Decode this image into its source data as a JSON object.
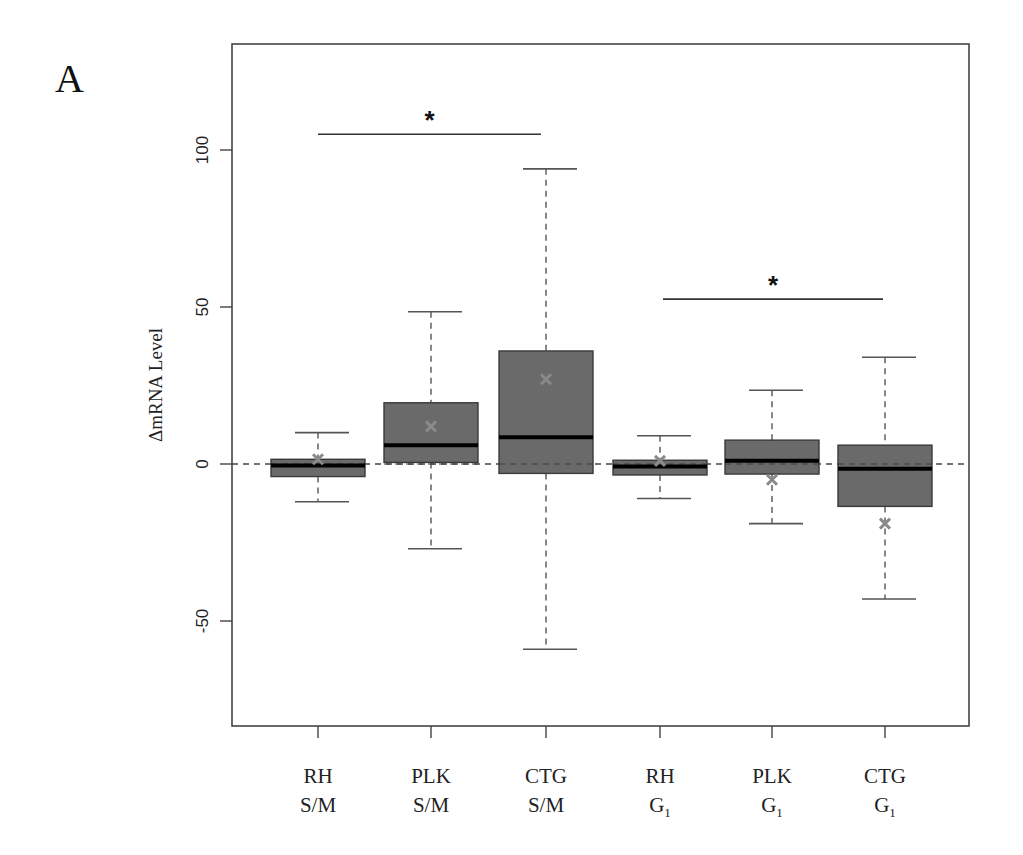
{
  "panel_label": "A",
  "colors": {
    "box_fill": "#6a6a6a",
    "box_stroke": "#3a3a3a",
    "median": "#000000",
    "whisker": "#555555",
    "mean_marker": "#8a8a8a",
    "axis": "#444444",
    "reference_line": "#444444",
    "background": "#ffffff"
  },
  "chart_data": {
    "type": "boxplot",
    "title": "",
    "xlabel": "",
    "ylabel": "ΔmRNA Level",
    "ylim": [
      -83,
      133
    ],
    "yticks": [
      -50,
      0,
      50,
      100
    ],
    "ytick_labels": [
      "-50",
      "0",
      "50",
      "100"
    ],
    "grid": false,
    "legend": null,
    "reference_line": {
      "y": 0,
      "style": "dashed"
    },
    "categories": [
      {
        "line1": "RH",
        "line2": "S/M",
        "sub": ""
      },
      {
        "line1": "PLK",
        "line2": "S/M",
        "sub": ""
      },
      {
        "line1": "CTG",
        "line2": "S/M",
        "sub": ""
      },
      {
        "line1": "RH",
        "line2": "G",
        "sub": "1"
      },
      {
        "line1": "PLK",
        "line2": "G",
        "sub": "1"
      },
      {
        "line1": "CTG",
        "line2": "G",
        "sub": "1"
      }
    ],
    "boxes": [
      {
        "label": "RH S/M",
        "whisker_low": -12,
        "q1": -4,
        "median": -0.5,
        "q3": 1.5,
        "whisker_high": 10,
        "mean": 1.5
      },
      {
        "label": "PLK S/M",
        "whisker_low": -27,
        "q1": 0.5,
        "median": 6,
        "q3": 19.5,
        "whisker_high": 48.5,
        "mean": 12
      },
      {
        "label": "CTG S/M",
        "whisker_low": -59,
        "q1": -3,
        "median": 8.5,
        "q3": 36,
        "whisker_high": 94,
        "mean": 27
      },
      {
        "label": "RH G1",
        "whisker_low": -11,
        "q1": -3.5,
        "median": -0.8,
        "q3": 1.2,
        "whisker_high": 9,
        "mean": 1
      },
      {
        "label": "PLK G1",
        "whisker_low": -19,
        "q1": -3.2,
        "median": 1,
        "q3": 7.6,
        "whisker_high": 23.5,
        "mean": -5
      },
      {
        "label": "CTG G1",
        "whisker_low": -43,
        "q1": -13.5,
        "median": -1.5,
        "q3": 6,
        "whisker_high": 34,
        "mean": -19
      }
    ],
    "annotations": [
      {
        "type": "significance",
        "from": 0,
        "to": 2,
        "y": 105,
        "label": "*"
      },
      {
        "type": "significance",
        "from": 3,
        "to": 5,
        "y": 52.5,
        "label": "*"
      }
    ]
  },
  "layout": {
    "plot_left": 232,
    "plot_right": 969,
    "plot_top": 44,
    "plot_bottom": 726,
    "y_zero_px": 464,
    "px_per_unit": 3.14,
    "x_centers": [
      318,
      431,
      546,
      660,
      772,
      885
    ],
    "box_half_width": 47,
    "cap_half_width": 30,
    "sig_bars": [
      {
        "x1": 318,
        "x2": 541
      },
      {
        "x1": 663,
        "x2": 883
      }
    ]
  }
}
